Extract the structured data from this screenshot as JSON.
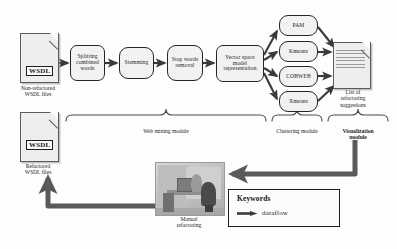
{
  "diagram": {
    "inputs": {
      "non_refactored": {
        "badge": "WSDL",
        "caption": "Non-refactored\nWSDL files"
      },
      "refactored": {
        "badge": "WSDL",
        "caption": "Refactored\nWSDL files"
      }
    },
    "web_mining_steps": [
      {
        "label": "Splitting\ncombined\nwords"
      },
      {
        "label": "Stemming"
      },
      {
        "label": "Stop words\nremoval"
      },
      {
        "label": "Vector space\nmodel\nrepresentation"
      }
    ],
    "clustering_algorithms": [
      {
        "label": "PAM"
      },
      {
        "label": "Kmeans"
      },
      {
        "label": "COBWEB"
      },
      {
        "label": "Xmeans"
      }
    ],
    "output": {
      "caption": "List of\nrefactoring\nsuggestions"
    },
    "module_labels": [
      {
        "label": "Web mining module",
        "bold": false
      },
      {
        "label": "Clustering module",
        "bold": false
      },
      {
        "label": "Visualization\nmodule",
        "bold": true
      }
    ],
    "manual": {
      "caption": "Manual\nrefactoring"
    },
    "legend": {
      "title": "Keywords",
      "entries": [
        {
          "symbol": "arrow",
          "label": "dataflow"
        }
      ]
    },
    "colors": {
      "background": "#fdfdfd",
      "node_fill": "#f2f2f2",
      "node_stroke": "#262626",
      "arrow_thin": "#3a3a3a",
      "arrow_thick": "#555555",
      "doc_fill": "#eeeeee",
      "doc_stroke": "#5b5b5b",
      "text": "#1d1d1d"
    }
  }
}
